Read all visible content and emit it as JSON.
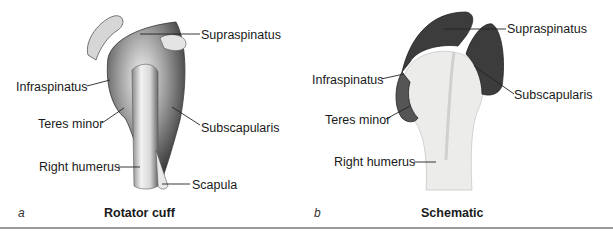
{
  "figure": {
    "panels": [
      {
        "letter": "a",
        "caption": "Rotator cuff",
        "labels": {
          "supraspinatus": "Supraspinatus",
          "infraspinatus": "Infraspinatus",
          "teres_minor": "Teres minor",
          "subscapularis": "Subscapularis",
          "right_humerus": "Right humerus",
          "scapula": "Scapula"
        }
      },
      {
        "letter": "b",
        "caption": "Schematic",
        "labels": {
          "supraspinatus": "Supraspinatus",
          "infraspinatus": "Infraspinatus",
          "teres_minor": "Teres minor",
          "subscapularis": "Subscapularis",
          "right_humerus": "Right humerus"
        }
      }
    ],
    "colors": {
      "muscle_dark": "#3c3c3c",
      "bone_light": "#ececea",
      "rule": "#9a9a9a"
    }
  }
}
